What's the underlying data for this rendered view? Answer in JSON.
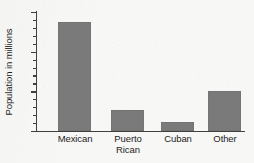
{
  "chart_data": {
    "type": "bar",
    "title": "",
    "xlabel": "",
    "ylabel": "Population in millions",
    "categories": [
      "Mexican",
      "Puerto Rican",
      "Cuban",
      "Other"
    ],
    "category_lines": [
      [
        "Mexican"
      ],
      [
        "Puerto",
        "Rican"
      ],
      [
        "Cuban"
      ],
      [
        "Other"
      ]
    ],
    "values": [
      13.8,
      2.6,
      1.1,
      5.0
    ],
    "ylim": [
      0,
      15
    ],
    "ytick_labels": [
      "0",
      "5",
      "10",
      "15"
    ],
    "ytick_values": [
      0,
      5,
      10,
      15
    ],
    "minor_tick_interval": 1,
    "grid": false,
    "legend": null,
    "bar_color": "#7a7a7a",
    "axis_color": "#404040",
    "background_color": "#f7f7f5"
  }
}
